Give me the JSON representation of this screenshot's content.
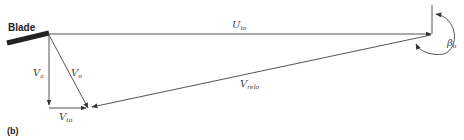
{
  "figure": {
    "panel_label": "(b)",
    "blade_label": "Blade",
    "colors": {
      "line": "#555555",
      "blade": "#222222",
      "text": "#444444"
    }
  },
  "vectors": {
    "U_to": {
      "symbol": "U",
      "subscript": "to"
    },
    "V_relo": {
      "symbol": "V",
      "subscript": "relo"
    },
    "V_a": {
      "symbol": "V",
      "subscript": "a"
    },
    "V_o": {
      "symbol": "V",
      "subscript": "o"
    },
    "V_to": {
      "symbol": "V",
      "subscript": "to"
    }
  },
  "angle": {
    "symbol": "β",
    "subscript": "o"
  }
}
